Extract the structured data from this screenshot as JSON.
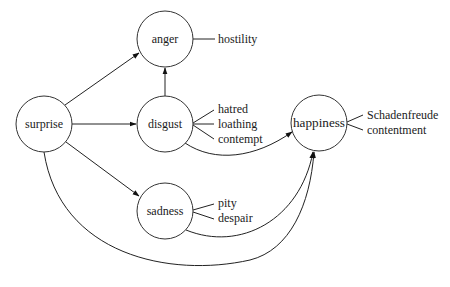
{
  "diagram": {
    "type": "emotion-transition-graph",
    "nodes": [
      {
        "id": "anger",
        "label": "anger",
        "cx": 165,
        "cy": 39,
        "r": 28
      },
      {
        "id": "surprise",
        "label": "surprise",
        "cx": 44,
        "cy": 124,
        "r": 28
      },
      {
        "id": "disgust",
        "label": "disgust",
        "cx": 165,
        "cy": 124,
        "r": 28
      },
      {
        "id": "happiness",
        "label": "happiness",
        "cx": 319,
        "cy": 123,
        "r": 28
      },
      {
        "id": "sadness",
        "label": "sadness",
        "cx": 165,
        "cy": 211,
        "r": 28
      }
    ],
    "edges": [
      {
        "from": "surprise",
        "to": "anger"
      },
      {
        "from": "surprise",
        "to": "disgust"
      },
      {
        "from": "surprise",
        "to": "sadness"
      },
      {
        "from": "disgust",
        "to": "anger"
      },
      {
        "from": "disgust",
        "to": "happiness"
      },
      {
        "from": "sadness",
        "to": "happiness"
      },
      {
        "from": "surprise",
        "to": "happiness"
      }
    ],
    "subtypes": {
      "anger": [
        "hostility"
      ],
      "disgust": [
        "hatred",
        "loathing",
        "contempt"
      ],
      "happiness": [
        "Schadenfreude",
        "contentment"
      ],
      "sadness": [
        "pity",
        "despair"
      ]
    }
  }
}
